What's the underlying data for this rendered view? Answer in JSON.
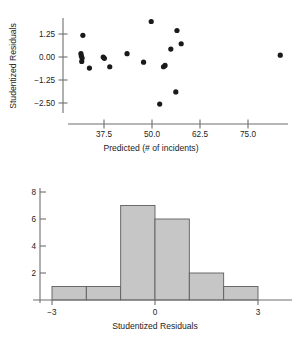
{
  "figure": {
    "kind": "regression-diagnostics",
    "panels": [
      "scatter-residual-plot",
      "residual-histogram"
    ]
  },
  "chart_data": [
    {
      "id": "residual-scatter",
      "type": "scatter",
      "title": "",
      "xlabel": "Predicted (# of incidents)",
      "ylabel": "Studentized Residuals",
      "xlim": [
        28.0,
        88.0
      ],
      "ylim": [
        -3.2,
        2.3
      ],
      "xticks": [
        37.5,
        50.0,
        62.5,
        75.0
      ],
      "xticklabels": [
        "37.5",
        "50.0",
        "62.5",
        "75.0"
      ],
      "yticks": [
        1.25,
        0.0,
        -1.25,
        -2.5
      ],
      "yticklabels": [
        "1.25",
        "0.00",
        "−1.25",
        "−2.50"
      ],
      "grid": false,
      "legend": null,
      "marker": "filled-circle",
      "marker_color": "#1a1a1a",
      "points": [
        {
          "x": 32.0,
          "y": 1.18
        },
        {
          "x": 31.5,
          "y": 0.18
        },
        {
          "x": 31.6,
          "y": 0.06
        },
        {
          "x": 31.8,
          "y": -0.06
        },
        {
          "x": 31.7,
          "y": -0.24
        },
        {
          "x": 33.7,
          "y": -0.6
        },
        {
          "x": 37.3,
          "y": 0.0
        },
        {
          "x": 37.6,
          "y": -0.07
        },
        {
          "x": 39.0,
          "y": -0.53
        },
        {
          "x": 43.5,
          "y": 0.18
        },
        {
          "x": 47.8,
          "y": -0.28
        },
        {
          "x": 49.8,
          "y": 1.93
        },
        {
          "x": 52.0,
          "y": -2.56
        },
        {
          "x": 53.0,
          "y": -0.53
        },
        {
          "x": 54.9,
          "y": 0.43
        },
        {
          "x": 53.4,
          "y": -0.46
        },
        {
          "x": 56.5,
          "y": 1.44
        },
        {
          "x": 57.6,
          "y": 0.72
        },
        {
          "x": 56.2,
          "y": -1.9
        },
        {
          "x": 83.4,
          "y": 0.1
        }
      ],
      "n_points": 20
    },
    {
      "id": "residual-histogram",
      "type": "bar",
      "title": "",
      "xlabel": "Studentized Residuals",
      "ylabel": "",
      "xlim": [
        -3.6,
        3.6
      ],
      "ylim": [
        0,
        8.6
      ],
      "xticks": [
        -3,
        0,
        3
      ],
      "xticklabels": [
        "−3",
        "0",
        "3"
      ],
      "yticks": [
        2,
        4,
        6,
        8
      ],
      "yticklabels": [
        "2",
        "4",
        "6",
        "8"
      ],
      "grid": false,
      "legend": null,
      "bin_edges": [
        -3.0,
        -2.0,
        -1.0,
        0.0,
        1.0,
        2.0,
        3.0
      ],
      "categories": [
        "−3 to −2",
        "−2 to −1",
        "−1 to 0",
        "0 to 1",
        "1 to 2",
        "2 to 3"
      ],
      "values": [
        1,
        1,
        7,
        6,
        2,
        1
      ],
      "bar_fill": "#c6c6c6",
      "bar_edge": "#5d5d5d"
    }
  ]
}
